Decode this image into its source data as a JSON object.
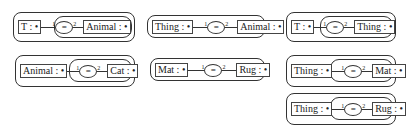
{
  "graphs": [
    {
      "id": "A",
      "left": "T : •",
      "relation": "=",
      "arc1": "1",
      "arc2": "2",
      "right": "Animal : •",
      "nested": true
    },
    {
      "id": "B",
      "left": "Thing : •",
      "relation": "=",
      "arc1": "1",
      "arc2": "2",
      "right": "Animal : •",
      "nested": false
    },
    {
      "id": "C",
      "left": "T : •",
      "relation": "=",
      "arc1": "1",
      "arc2": "2",
      "right": "Thing : •",
      "nested": true
    },
    {
      "id": "D",
      "left": "Animal : •",
      "relation": "=",
      "arc1": "1",
      "arc2": "2",
      "right": "Cat : •",
      "nested": true
    },
    {
      "id": "E",
      "left": "Mat : •",
      "relation": "=",
      "arc1": "1",
      "arc2": "2",
      "right": "Rug : •",
      "nested": false
    },
    {
      "id": "F",
      "left": "Thing : •",
      "relation": "=",
      "arc1": "1",
      "arc2": "2",
      "right": "Mat : •",
      "nested": true
    },
    {
      "id": "G",
      "left": "Thing : •",
      "relation": "=",
      "arc1": "1",
      "arc2": "2",
      "right": "Rug : •",
      "nested": true
    }
  ]
}
